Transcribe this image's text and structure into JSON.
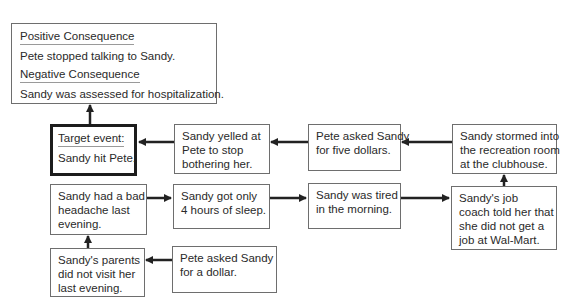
{
  "diagram": {
    "consequences": {
      "positive_header": "Positive Consequence",
      "positive_text": "Pete stopped talking to Sandy.",
      "negative_header": "Negative Consequence",
      "negative_text": "Sandy was assessed for hospitalization."
    },
    "target": {
      "header": "Target event:",
      "text": "Sandy hit Pete."
    },
    "nodes": {
      "yelled": [
        "Sandy yelled at",
        "Pete to stop",
        "bothering her."
      ],
      "five_dollars": [
        "Pete asked Sandy",
        "for five dollars."
      ],
      "stormed": [
        "Sandy stormed into",
        "the recreation room",
        "at the clubhouse."
      ],
      "headache": [
        "Sandy had a bad",
        "headache last",
        "evening."
      ],
      "sleep": [
        "Sandy got only",
        "4 hours of sleep."
      ],
      "tired": [
        "Sandy was tired",
        "in the morning."
      ],
      "job_coach": [
        "Sandy's job",
        "coach told her that",
        "she did not get a",
        "job at Wal-Mart."
      ],
      "parents": [
        "Sandy's parents",
        "did not visit her",
        "last evening."
      ],
      "dollar": [
        "Pete asked Sandy",
        "for a dollar."
      ]
    },
    "edges": [
      {
        "from": "dollar",
        "to": "parents"
      },
      {
        "from": "parents",
        "to": "headache"
      },
      {
        "from": "headache",
        "to": "sleep"
      },
      {
        "from": "sleep",
        "to": "tired"
      },
      {
        "from": "tired",
        "to": "job_coach"
      },
      {
        "from": "job_coach",
        "to": "stormed"
      },
      {
        "from": "stormed",
        "to": "five_dollars"
      },
      {
        "from": "five_dollars",
        "to": "yelled"
      },
      {
        "from": "yelled",
        "to": "target"
      },
      {
        "from": "target",
        "to": "consequences"
      }
    ],
    "colors": {
      "box_border": "#6e6e6e",
      "target_border": "#1c1c1c",
      "arrow": "#222222"
    }
  }
}
